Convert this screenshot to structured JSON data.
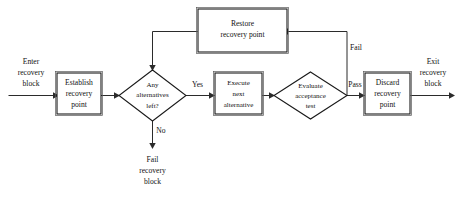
{
  "diagram": {
    "type": "flowchart",
    "colors": {
      "background": "#ffffff",
      "node_fill": "#ffffff",
      "node_stroke": "#1a1a1a",
      "edge_stroke": "#2b2b2b",
      "text": "#111111"
    },
    "nodes": [
      {
        "id": "establish",
        "shape": "rectangle",
        "lines": [
          "Establish",
          "recovery",
          "point"
        ]
      },
      {
        "id": "any-alternatives",
        "shape": "diamond",
        "lines": [
          "Any",
          "alternatives",
          "left?"
        ]
      },
      {
        "id": "execute-next",
        "shape": "rectangle",
        "lines": [
          "Execute",
          "next",
          "alternative"
        ]
      },
      {
        "id": "evaluate-acceptance",
        "shape": "diamond",
        "lines": [
          "Evaluate",
          "acceptance",
          "test"
        ]
      },
      {
        "id": "discard",
        "shape": "rectangle",
        "lines": [
          "Discard",
          "recovery",
          "point"
        ]
      },
      {
        "id": "restore",
        "shape": "rectangle",
        "lines": [
          "Restore",
          "recovery point"
        ]
      }
    ],
    "edge_labels": {
      "yes": "Yes",
      "no": "No",
      "pass": "Pass",
      "fail": "Fail"
    },
    "io_labels": {
      "enter": [
        "Enter",
        "recovery",
        "block"
      ],
      "exit": [
        "Exit",
        "recovery",
        "block"
      ],
      "fail_terminal": [
        "Fail",
        "recovery",
        "block"
      ]
    },
    "node_text": {
      "establish_1": "Establish",
      "establish_2": "recovery",
      "establish_3": "point",
      "any_1": "Any",
      "any_2": "alternatives",
      "any_3": "left?",
      "execute_1": "Execute",
      "execute_2": "next",
      "execute_3": "alternative",
      "evaluate_1": "Evaluate",
      "evaluate_2": "acceptance",
      "evaluate_3": "test",
      "discard_1": "Discard",
      "discard_2": "recovery",
      "discard_3": "point",
      "restore_1": "Restore",
      "restore_2": "recovery point",
      "enter_1": "Enter",
      "enter_2": "recovery",
      "enter_3": "block",
      "exit_1": "Exit",
      "exit_2": "recovery",
      "exit_3": "block",
      "failterm_1": "Fail",
      "failterm_2": "recovery",
      "failterm_3": "block"
    }
  }
}
